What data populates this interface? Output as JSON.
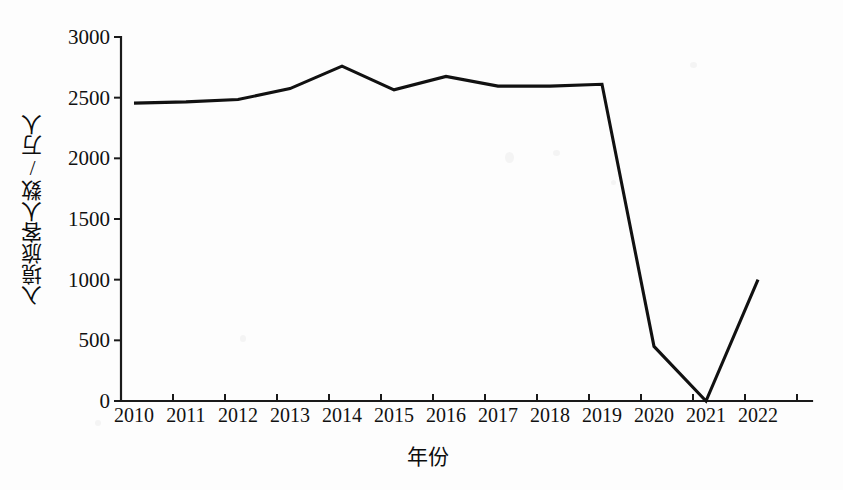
{
  "chart_data": {
    "type": "line",
    "title": "",
    "xlabel": "年份",
    "ylabel": "入境旅客人数/万人",
    "categories": [
      "2010",
      "2011",
      "2012",
      "2013",
      "2014",
      "2015",
      "2016",
      "2017",
      "2018",
      "2019",
      "2020",
      "2021",
      "2022"
    ],
    "values": [
      2455,
      2465,
      2485,
      2575,
      2760,
      2565,
      2675,
      2595,
      2595,
      2610,
      450,
      0,
      1000
    ],
    "series": [
      {
        "name": "入境旅客人数",
        "values": [
          2455,
          2465,
          2485,
          2575,
          2760,
          2565,
          2675,
          2595,
          2595,
          2610,
          450,
          0,
          1000
        ]
      }
    ],
    "ylim": [
      0,
      3000
    ],
    "yticks": [
      0,
      500,
      1000,
      1500,
      2000,
      2500,
      3000
    ],
    "ytick_labels": [
      "0",
      "500",
      "1000",
      "1500",
      "2000",
      "2500",
      "3000"
    ],
    "xtick_labels": [
      "2010",
      "2011",
      "2012",
      "2013",
      "2014",
      "2015",
      "2016",
      "2017",
      "2018",
      "2019",
      "2020",
      "2021",
      "2022"
    ],
    "grid": false,
    "legend": "none",
    "line_color": "#111111",
    "background_color": "#fdfdfd"
  }
}
